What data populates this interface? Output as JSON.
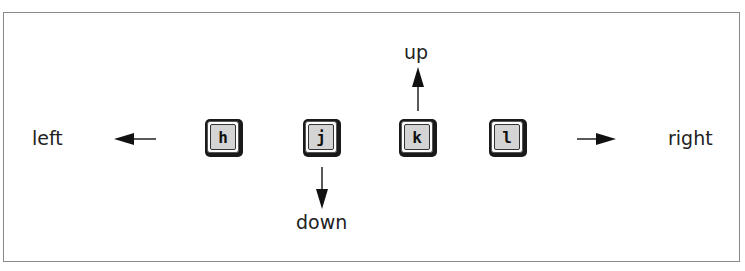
{
  "diagram": {
    "keys": [
      {
        "key": "h",
        "direction": "left"
      },
      {
        "key": "j",
        "direction": "down"
      },
      {
        "key": "k",
        "direction": "up"
      },
      {
        "key": "l",
        "direction": "right"
      }
    ],
    "labels": {
      "left": "left",
      "right": "right",
      "up": "up",
      "down": "down"
    },
    "icons": {
      "left_arrow": "arrow-left-icon",
      "right_arrow": "arrow-right-icon",
      "up_arrow": "arrow-up-icon",
      "down_arrow": "arrow-down-icon"
    },
    "colors": {
      "key_face": "#d4d4d4",
      "key_shadow": "#1a1a1a",
      "frame_border": "#8a8a8a",
      "text": "#222222"
    }
  }
}
